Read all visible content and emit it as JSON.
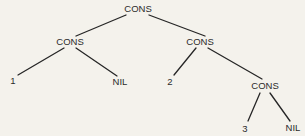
{
  "diagram": {
    "type": "tree",
    "colors": {
      "background": "#f4f2ec",
      "ink": "#2b2b2b"
    },
    "nodes": [
      {
        "id": "root",
        "label": "CONS",
        "x": 138,
        "y": 9
      },
      {
        "id": "left",
        "label": "CONS",
        "x": 70,
        "y": 42
      },
      {
        "id": "right",
        "label": "CONS",
        "x": 200,
        "y": 42
      },
      {
        "id": "leaf1",
        "label": "1",
        "x": 13,
        "y": 81
      },
      {
        "id": "nil1",
        "label": "NIL",
        "x": 120,
        "y": 82
      },
      {
        "id": "leaf2",
        "label": "2",
        "x": 170,
        "y": 82
      },
      {
        "id": "bottom",
        "label": "CONS",
        "x": 265,
        "y": 86
      },
      {
        "id": "leaf3",
        "label": "3",
        "x": 245,
        "y": 129
      },
      {
        "id": "nil2",
        "label": "NIL",
        "x": 293,
        "y": 128
      }
    ],
    "edges": [
      {
        "from": "root",
        "to": "left",
        "x1": 126,
        "y1": 15,
        "x2": 76,
        "y2": 36
      },
      {
        "from": "root",
        "to": "right",
        "x1": 149,
        "y1": 15,
        "x2": 205,
        "y2": 36
      },
      {
        "from": "left",
        "to": "leaf1",
        "x1": 64,
        "y1": 48,
        "x2": 18,
        "y2": 75
      },
      {
        "from": "left",
        "to": "nil1",
        "x1": 76,
        "y1": 48,
        "x2": 117,
        "y2": 76
      },
      {
        "from": "right",
        "to": "leaf2",
        "x1": 196,
        "y1": 48,
        "x2": 174,
        "y2": 75
      },
      {
        "from": "right",
        "to": "bottom",
        "x1": 208,
        "y1": 48,
        "x2": 262,
        "y2": 79
      },
      {
        "from": "bottom",
        "to": "leaf3",
        "x1": 260,
        "y1": 93,
        "x2": 248,
        "y2": 121
      },
      {
        "from": "bottom",
        "to": "nil2",
        "x1": 270,
        "y1": 93,
        "x2": 290,
        "y2": 121
      }
    ]
  }
}
